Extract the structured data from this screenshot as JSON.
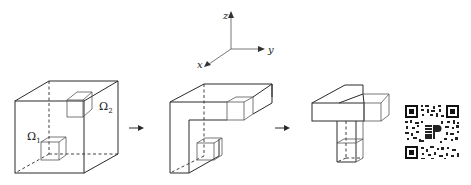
{
  "figure": {
    "axes": {
      "x_label": "x",
      "y_label": "y",
      "z_label": "z"
    },
    "stages": [
      {
        "name": "full-cube",
        "regions": [
          {
            "symbol": "Ω",
            "subscript": "1"
          },
          {
            "symbol": "Ω",
            "subscript": "2"
          }
        ]
      },
      {
        "name": "l-shaped-channel"
      },
      {
        "name": "reduced-channel"
      }
    ],
    "arrows": [
      "→",
      "→"
    ],
    "colors": {
      "stroke": "#2a2a2a",
      "background": "#ffffff"
    }
  }
}
